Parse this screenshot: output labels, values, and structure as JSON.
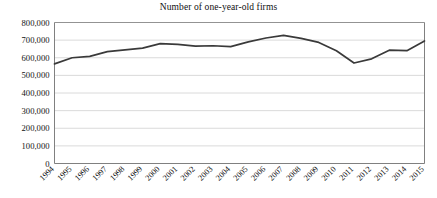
{
  "chart_data": {
    "type": "line",
    "title": "Number of one-year-old firms",
    "xlabel": "",
    "ylabel": "",
    "grid": true,
    "legend": false,
    "ylim": [
      0,
      800000
    ],
    "ytick_labels": [
      "800,000",
      "700,000",
      "600,000",
      "500,000",
      "400,000",
      "300,000",
      "200,000",
      "100,000",
      "0"
    ],
    "ytick_values": [
      800000,
      700000,
      600000,
      500000,
      400000,
      300000,
      200000,
      100000,
      0
    ],
    "categories": [
      "1994",
      "1995",
      "1996",
      "1997",
      "1998",
      "1999",
      "2000",
      "2001",
      "2002",
      "2003",
      "2004",
      "2005",
      "2006",
      "2007",
      "2008",
      "2009",
      "2010",
      "2011",
      "2012",
      "2013",
      "2014",
      "2015"
    ],
    "values": [
      565000,
      600000,
      608000,
      635000,
      645000,
      655000,
      680000,
      676000,
      666000,
      668000,
      663000,
      690000,
      712000,
      727000,
      710000,
      687000,
      640000,
      570000,
      594000,
      643000,
      640000,
      695000
    ],
    "series": [
      {
        "name": "Number of one-year-old firms",
        "color": "#3a3a3a",
        "values": [
          565000,
          600000,
          608000,
          635000,
          645000,
          655000,
          680000,
          676000,
          666000,
          668000,
          663000,
          690000,
          712000,
          727000,
          710000,
          687000,
          640000,
          570000,
          594000,
          643000,
          640000,
          695000
        ]
      }
    ]
  },
  "style": {
    "line_color": "#3a3a3a",
    "grid_color": "#d0d0d0",
    "axis_color": "#808080",
    "text_color": "#111111"
  }
}
